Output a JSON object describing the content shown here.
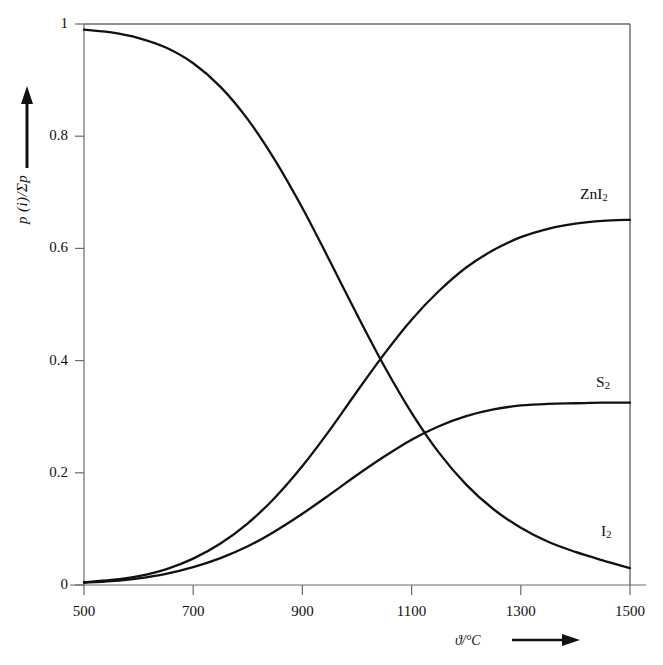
{
  "figure": {
    "background_color": "#ffffff",
    "line_color": "#111111",
    "axis_color": "#555555"
  },
  "axes": {
    "y_title_main": "p",
    "y_title_paren": "(i)",
    "y_title_rest": "/Σp",
    "y_title_full": "p (i)/Σp",
    "y_arrow": "↑",
    "x_title": "ϑ/°C",
    "x_arrow": "⟶",
    "x_unit": "°C",
    "x_symbol": "ϑ/"
  },
  "y_ticks": [
    {
      "value": 1,
      "label": "1"
    },
    {
      "value": 0.8,
      "label": "0.8"
    },
    {
      "value": 0.6,
      "label": "0.6"
    },
    {
      "value": 0.4,
      "label": "0.4"
    },
    {
      "value": 0.2,
      "label": "0.2"
    },
    {
      "value": 0,
      "label": "0"
    }
  ],
  "x_ticks": [
    {
      "value": 500,
      "label": "500"
    },
    {
      "value": 700,
      "label": "700"
    },
    {
      "value": 900,
      "label": "900"
    },
    {
      "value": 1100,
      "label": "1100"
    },
    {
      "value": 1300,
      "label": "1300"
    },
    {
      "value": 1500,
      "label": "1500"
    }
  ],
  "series_labels": {
    "znI2": "ZnI",
    "znI2_sub": "2",
    "s2": "S",
    "s2_sub": "2",
    "i2": "I",
    "i2_sub": "2"
  },
  "chart_data": {
    "type": "line",
    "title": "",
    "xlabel": "ϑ/°C",
    "ylabel": "p (i)/Σp",
    "xlim": [
      500,
      1500
    ],
    "ylim": [
      0,
      1
    ],
    "grid": false,
    "legend": "inline-right-of-curves",
    "x": [
      500,
      550,
      600,
      650,
      700,
      750,
      800,
      850,
      900,
      950,
      1000,
      1050,
      1100,
      1150,
      1200,
      1250,
      1300,
      1350,
      1400,
      1450,
      1500
    ],
    "series": [
      {
        "name": "I2",
        "label": "I₂",
        "values": [
          0.99,
          0.985,
          0.975,
          0.958,
          0.93,
          0.888,
          0.83,
          0.757,
          0.672,
          0.578,
          0.482,
          0.39,
          0.307,
          0.236,
          0.179,
          0.135,
          0.102,
          0.077,
          0.059,
          0.044,
          0.03
        ]
      },
      {
        "name": "ZnI2",
        "label": "ZnI₂",
        "values": [
          0.005,
          0.009,
          0.016,
          0.028,
          0.047,
          0.074,
          0.11,
          0.156,
          0.212,
          0.276,
          0.345,
          0.412,
          0.473,
          0.524,
          0.566,
          0.597,
          0.62,
          0.635,
          0.644,
          0.649,
          0.651
        ]
      },
      {
        "name": "S2",
        "label": "S₂",
        "values": [
          0.004,
          0.007,
          0.012,
          0.02,
          0.032,
          0.048,
          0.069,
          0.096,
          0.127,
          0.161,
          0.196,
          0.229,
          0.259,
          0.283,
          0.301,
          0.313,
          0.32,
          0.323,
          0.324,
          0.325,
          0.325
        ]
      }
    ],
    "annotations": [
      {
        "text": "I₂ and ZnI₂ cross",
        "x": 969,
        "y": 0.401
      },
      {
        "text": "I₂ and S₂ cross",
        "x": 1070,
        "y": 0.253
      }
    ]
  }
}
